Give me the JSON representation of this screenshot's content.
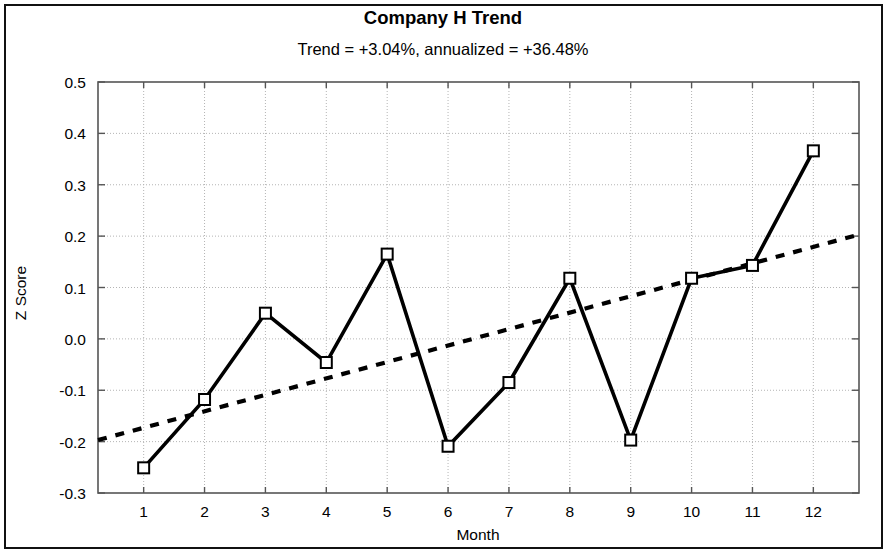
{
  "chart_data": {
    "type": "line",
    "title": "Company H Trend",
    "subtitle": "Trend = +3.04%,  annualized = +36.48%",
    "xlabel": "Month",
    "ylabel": "Z Score",
    "xlim": [
      0.25,
      12.75
    ],
    "ylim": [
      -0.3,
      0.5
    ],
    "xticks": [
      1,
      2,
      3,
      4,
      5,
      6,
      7,
      8,
      9,
      10,
      11,
      12
    ],
    "xtick_labels": [
      "1",
      "2",
      "3",
      "4",
      "5",
      "6",
      "7",
      "8",
      "9",
      "10",
      "11",
      "12"
    ],
    "yticks": [
      -0.3,
      -0.2,
      -0.1,
      0.0,
      0.1,
      0.2,
      0.3,
      0.4,
      0.5
    ],
    "ytick_labels": [
      "-0.3",
      "-0.2",
      "-0.1",
      "0.0",
      "0.1",
      "0.2",
      "0.3",
      "0.4",
      "0.5"
    ],
    "grid": true,
    "grid_style": "dotted",
    "legend": null,
    "x": [
      1,
      2,
      3,
      4,
      5,
      6,
      7,
      8,
      9,
      10,
      11,
      12
    ],
    "series": [
      {
        "name": "Z Score",
        "style": "solid",
        "marker": "open-square",
        "color": "#000000",
        "values": [
          -0.251,
          -0.118,
          0.05,
          -0.046,
          0.165,
          -0.209,
          -0.085,
          0.118,
          -0.197,
          0.118,
          0.143,
          0.366
        ]
      },
      {
        "name": "Trend",
        "style": "dotted",
        "marker": "none",
        "color": "#000000",
        "x_endpoints": [
          0.25,
          12.75
        ],
        "y_endpoints": [
          -0.197,
          0.203
        ]
      }
    ],
    "trend_percent": "+3.04%",
    "annualized_percent": "+36.48%"
  },
  "axes": {
    "frame_color": "#555555",
    "grid_color": "#b4b4b4",
    "background": "#ffffff"
  }
}
